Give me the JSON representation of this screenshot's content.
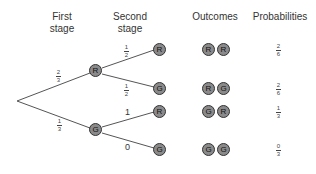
{
  "headers": {
    "first_stage": [
      "First",
      "stage"
    ],
    "second_stage": [
      "Second",
      "stage"
    ],
    "outcomes": "Outcomes",
    "probabilities": "Probabilities"
  },
  "colors": {
    "node_fill": "#8a8a8a",
    "node_stroke": "#333333",
    "line": "#555555"
  },
  "first_stage": {
    "nodes": [
      {
        "label": "R",
        "branch_prob": {
          "num": "2",
          "den": "3"
        }
      },
      {
        "label": "G",
        "branch_prob": {
          "num": "1",
          "den": "3"
        }
      }
    ]
  },
  "second_stage": {
    "nodes": [
      {
        "label": "R",
        "branch_prob": {
          "num": "1",
          "den": "2"
        }
      },
      {
        "label": "G",
        "branch_prob": {
          "num": "1",
          "den": "2"
        }
      },
      {
        "label": "R",
        "branch_prob": "1"
      },
      {
        "label": "G",
        "branch_prob": "0"
      }
    ]
  },
  "outcomes": [
    {
      "a": "R",
      "b": "R",
      "prob": {
        "num": "2",
        "den": "6"
      }
    },
    {
      "a": "R",
      "b": "G",
      "prob": {
        "num": "2",
        "den": "6"
      }
    },
    {
      "a": "G",
      "b": "R",
      "prob": {
        "num": "1",
        "den": "3"
      }
    },
    {
      "a": "G",
      "b": "G",
      "prob": {
        "num": "0",
        "den": "3"
      }
    }
  ]
}
